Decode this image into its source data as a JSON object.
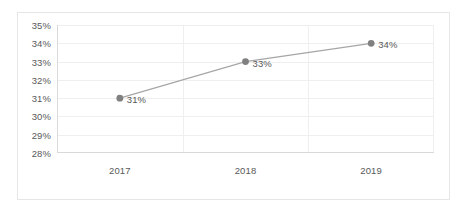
{
  "chart_data": {
    "type": "line",
    "title": "",
    "subtitle": "",
    "xlabel": "",
    "ylabel": "",
    "categories": [
      "2017",
      "2018",
      "2019"
    ],
    "values": [
      31,
      33,
      34
    ],
    "point_labels": [
      "31%",
      "33%",
      "34%"
    ],
    "ytick_labels": [
      "35%",
      "34%",
      "33%",
      "32%",
      "31%",
      "30%",
      "29%",
      "28%"
    ],
    "ytick_values": [
      35,
      34,
      33,
      32,
      31,
      30,
      29,
      28
    ],
    "ylim": [
      28,
      35
    ],
    "grid": {
      "horizontal": true,
      "vertical": true
    },
    "legend": {
      "visible": false,
      "position": "none"
    },
    "series": [
      {
        "name": "Series 1",
        "values": [
          31,
          33,
          34
        ],
        "line_color": "#a6a6a6",
        "marker_color": "#808080",
        "marker_shape": "circle"
      }
    ],
    "colors": {
      "line": "#a6a6a6",
      "marker": "#808080",
      "gridline": "#efefef",
      "axis": "#d9d9d9",
      "border": "#e6e6e6",
      "text": "#595959",
      "background": "#ffffff"
    }
  }
}
